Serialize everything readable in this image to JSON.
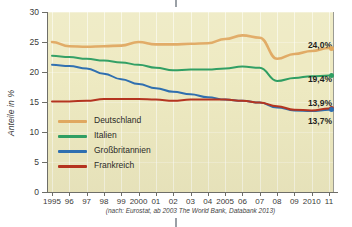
{
  "chart_data": {
    "type": "line",
    "title": "",
    "xlabel": "",
    "ylabel": "Anteile in %",
    "ylim": [
      0,
      30
    ],
    "yticks": [
      0,
      5,
      10,
      15,
      20,
      25,
      30
    ],
    "ytick_labels": [
      "0",
      "5",
      "10",
      "15",
      "20",
      "25",
      "30"
    ],
    "grid": true,
    "legend_position": "inside-lower-left",
    "x": [
      1995,
      1996,
      1997,
      1998,
      1999,
      2000,
      2001,
      2002,
      2003,
      2004,
      2005,
      2006,
      2007,
      2008,
      2009,
      2010,
      2011
    ],
    "xtick_labels": [
      "1995",
      "96",
      "97",
      "98",
      "99",
      "2000",
      "01",
      "02",
      "03",
      "04",
      "2005",
      "06",
      "07",
      "08",
      "09",
      "2010",
      "11"
    ],
    "series": [
      {
        "name": "Deutschland",
        "color": "#e0a860",
        "end_label": "24,0%",
        "values": [
          25.0,
          24.3,
          24.2,
          24.3,
          24.4,
          25.0,
          24.6,
          24.6,
          24.7,
          24.8,
          25.5,
          26.1,
          25.7,
          22.2,
          23.0,
          23.5,
          24.0
        ]
      },
      {
        "name": "Italien",
        "color": "#2f9e63",
        "end_label": "19,4%",
        "values": [
          22.7,
          22.5,
          22.2,
          21.9,
          21.6,
          21.2,
          20.7,
          20.3,
          20.4,
          20.4,
          20.6,
          20.9,
          20.7,
          18.5,
          19.0,
          19.3,
          19.4
        ]
      },
      {
        "name": "Großbritannien",
        "color": "#2f6fb0",
        "end_label": "13,7%",
        "values": [
          21.2,
          21.0,
          20.6,
          19.7,
          18.8,
          18.0,
          17.3,
          16.7,
          16.3,
          15.8,
          15.4,
          15.2,
          14.9,
          14.1,
          13.6,
          13.5,
          13.7
        ]
      },
      {
        "name": "Frankreich",
        "color": "#b5331f",
        "end_label": "13,9%",
        "values": [
          15.1,
          15.1,
          15.2,
          15.5,
          15.5,
          15.5,
          15.4,
          15.2,
          15.4,
          15.4,
          15.4,
          15.2,
          14.9,
          14.3,
          13.7,
          13.6,
          13.9
        ]
      }
    ],
    "source_note": "(nach: Eurostat, ab 2003 The World Bank, Databank 2013)"
  },
  "legend": {
    "items": [
      {
        "label": "Deutschland",
        "color": "#e0a860"
      },
      {
        "label": "Italien",
        "color": "#2f9e63"
      },
      {
        "label": "Großbritannien",
        "color": "#2f6fb0"
      },
      {
        "label": "Frankreich",
        "color": "#b5331f"
      }
    ]
  },
  "end_labels": [
    {
      "text": "24,0%",
      "color": "#e0a860"
    },
    {
      "text": "19,4%",
      "color": "#2f9e63"
    },
    {
      "text": "13,9%",
      "color": "#b5331f"
    },
    {
      "text": "13,7%",
      "color": "#2f6fb0"
    }
  ],
  "colors": {
    "plot_background": "#eeeac2",
    "axis": "#6e6e68",
    "text": "#3a3a38"
  }
}
